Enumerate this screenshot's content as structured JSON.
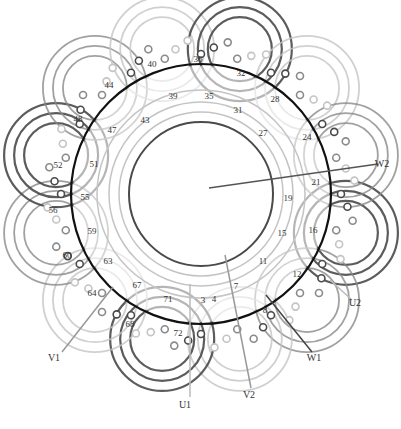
{
  "diagram": {
    "title": "",
    "center": [
      201,
      194
    ],
    "stator_radius": 130,
    "inner_radius": 72,
    "colors": {
      "stator": "#111111",
      "phase_dark": "#4a4a4a",
      "phase_mid": "#8a8a8a",
      "phase_light": "#c4c4c4"
    },
    "slot_labels": [
      {
        "text": "36",
        "x": 198,
        "y": 62
      },
      {
        "text": "40",
        "x": 152,
        "y": 67
      },
      {
        "text": "32",
        "x": 241,
        "y": 76
      },
      {
        "text": "44",
        "x": 109,
        "y": 88
      },
      {
        "text": "39",
        "x": 173,
        "y": 99
      },
      {
        "text": "35",
        "x": 209,
        "y": 99
      },
      {
        "text": "28",
        "x": 275,
        "y": 102
      },
      {
        "text": "48",
        "x": 78,
        "y": 122
      },
      {
        "text": "43",
        "x": 145,
        "y": 123
      },
      {
        "text": "31",
        "x": 238,
        "y": 113
      },
      {
        "text": "47",
        "x": 112,
        "y": 133
      },
      {
        "text": "27",
        "x": 263,
        "y": 136
      },
      {
        "text": "24",
        "x": 307,
        "y": 140
      },
      {
        "text": "52",
        "x": 58,
        "y": 168
      },
      {
        "text": "51",
        "x": 94,
        "y": 167
      },
      {
        "text": "21",
        "x": 316,
        "y": 185
      },
      {
        "text": "55",
        "x": 85,
        "y": 200
      },
      {
        "text": "19",
        "x": 288,
        "y": 201
      },
      {
        "text": "56",
        "x": 53,
        "y": 213
      },
      {
        "text": "59",
        "x": 92,
        "y": 234
      },
      {
        "text": "15",
        "x": 282,
        "y": 236
      },
      {
        "text": "16",
        "x": 313,
        "y": 233
      },
      {
        "text": "60",
        "x": 67,
        "y": 258
      },
      {
        "text": "63",
        "x": 108,
        "y": 264
      },
      {
        "text": "11",
        "x": 263,
        "y": 264
      },
      {
        "text": "12",
        "x": 297,
        "y": 277
      },
      {
        "text": "67",
        "x": 137,
        "y": 288
      },
      {
        "text": "64",
        "x": 92,
        "y": 296
      },
      {
        "text": "71",
        "x": 168,
        "y": 302
      },
      {
        "text": "7",
        "x": 236,
        "y": 289
      },
      {
        "text": "3",
        "x": 203,
        "y": 303
      },
      {
        "text": "4",
        "x": 214,
        "y": 302
      },
      {
        "text": "8",
        "x": 265,
        "y": 313
      },
      {
        "text": "68",
        "x": 130,
        "y": 327
      },
      {
        "text": "72",
        "x": 178,
        "y": 336
      }
    ],
    "leads": [
      {
        "text": "W2",
        "x": 382,
        "y": 167,
        "from": [
          209,
          188
        ],
        "to": [
          378,
          164
        ],
        "color": "#555555"
      },
      {
        "text": "U2",
        "x": 355,
        "y": 306,
        "from": [
          330,
          280
        ],
        "to": [
          352,
          300
        ],
        "color": "#bbbbbb"
      },
      {
        "text": "W1",
        "x": 314,
        "y": 361,
        "from": [
          266,
          295
        ],
        "to": [
          312,
          352
        ],
        "color": "#444444"
      },
      {
        "text": "V2",
        "x": 249,
        "y": 398,
        "from": [
          225,
          255
        ],
        "to": [
          251,
          388
        ],
        "color": "#999999"
      },
      {
        "text": "V1",
        "x": 54,
        "y": 361,
        "from": [
          113,
          287
        ],
        "to": [
          62,
          352
        ],
        "color": "#999999"
      },
      {
        "text": "U1",
        "x": 185,
        "y": 408,
        "from": [
          190,
          284
        ],
        "to": [
          190,
          397
        ],
        "color": "#bbbbbb"
      }
    ]
  }
}
